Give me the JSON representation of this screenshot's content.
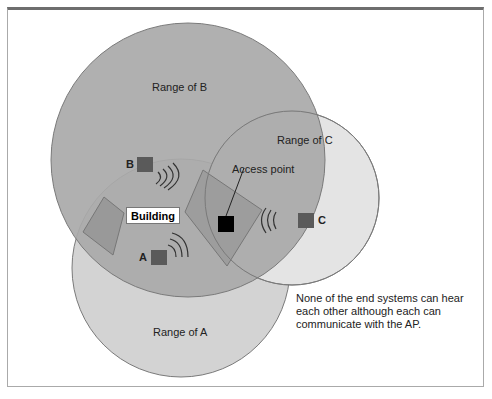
{
  "diagram": {
    "labels": {
      "range_b": "Range of B",
      "range_c": "Range of C",
      "range_a": "Range of A",
      "access_point": "Access point",
      "building": "Building",
      "node_a": "A",
      "node_b": "B",
      "node_c": "C"
    },
    "note": "None of the end systems can hear each other although each can communicate with the AP.",
    "colors": {
      "range_b_fill": "#a9a9a9",
      "range_a_fill": "#d2d2d2",
      "range_c_fill": "#e2e2e2",
      "overlap_fill": "#9a9a9a",
      "node_fill": "#5a5a5a",
      "ap_fill": "#000000",
      "outline": "#777777"
    }
  }
}
